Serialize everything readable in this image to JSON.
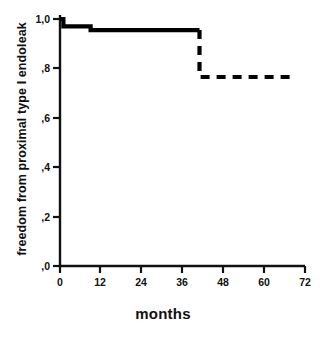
{
  "chart_data": {
    "type": "line",
    "title": "",
    "xlabel": "months",
    "ylabel": "freedom from proximal type I endoleak",
    "xlim": [
      0,
      72
    ],
    "ylim": [
      0.0,
      1.0
    ],
    "grid": false,
    "legend": "none",
    "xticks": [
      "0",
      "12",
      "24",
      "36",
      "48",
      "60",
      "72"
    ],
    "xtick_values": [
      0,
      12,
      24,
      36,
      48,
      60,
      72
    ],
    "yticks": [
      "0,0",
      ",2",
      ",4",
      ",6",
      ",8",
      "1,0"
    ],
    "ytick_values": [
      0.0,
      0.2,
      0.4,
      0.6,
      0.8,
      1.0
    ],
    "ytick_labels_shown": [
      ",0",
      ",2",
      ",4",
      ",6",
      ",8",
      "1,0"
    ],
    "decimal_separator": ",",
    "line_color": "#000000",
    "series": [
      {
        "name": "freedom from proximal type I endoleak (solid)",
        "style": "solid",
        "x": [
          0,
          1,
          1,
          9,
          9,
          41
        ],
        "y": [
          1.0,
          1.0,
          0.97,
          0.97,
          0.955,
          0.955
        ]
      },
      {
        "name": "freedom from proximal type I endoleak (dashed extrapolation)",
        "style": "dashed",
        "x": [
          41,
          41,
          68
        ],
        "y": [
          0.955,
          0.765,
          0.765
        ]
      }
    ],
    "steps": [
      {
        "month": 0,
        "value": 1.0
      },
      {
        "month": 1,
        "value": 0.97
      },
      {
        "month": 9,
        "value": 0.955
      },
      {
        "month": 41,
        "value": 0.765
      },
      {
        "month": 68,
        "value": 0.765
      }
    ],
    "annotations": []
  }
}
